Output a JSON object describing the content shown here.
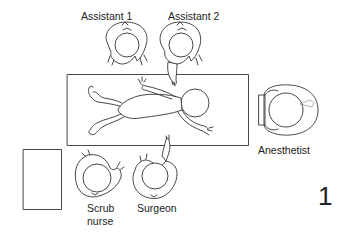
{
  "diagram": {
    "type": "operating-room-layout",
    "figure_number": "1",
    "labels": {
      "assistant_1": "Assistant 1",
      "assistant_2": "Assistant 2",
      "anesthetist": "Anesthetist",
      "scrub_nurse_line1": "Scrub",
      "scrub_nurse_line2": "nurse",
      "surgeon": "Surgeon"
    },
    "elements": [
      {
        "id": "operating-table",
        "kind": "rectangle",
        "contains": "infant patient (supine, head toward anesthetist)"
      },
      {
        "id": "instrument-table",
        "kind": "rectangle",
        "position": "bottom-left"
      },
      {
        "id": "assistant-1",
        "kind": "person-top-view",
        "position": "top, above table left-center"
      },
      {
        "id": "assistant-2",
        "kind": "person-top-view",
        "position": "top, above table center"
      },
      {
        "id": "anesthetist",
        "kind": "person-top-view",
        "position": "right, at head of table"
      },
      {
        "id": "scrub-nurse",
        "kind": "person-top-view",
        "position": "bottom, next to instrument table"
      },
      {
        "id": "surgeon",
        "kind": "person-top-view",
        "position": "bottom, below table center"
      }
    ],
    "colors": {
      "line": "#333333",
      "background": "#ffffff"
    }
  }
}
